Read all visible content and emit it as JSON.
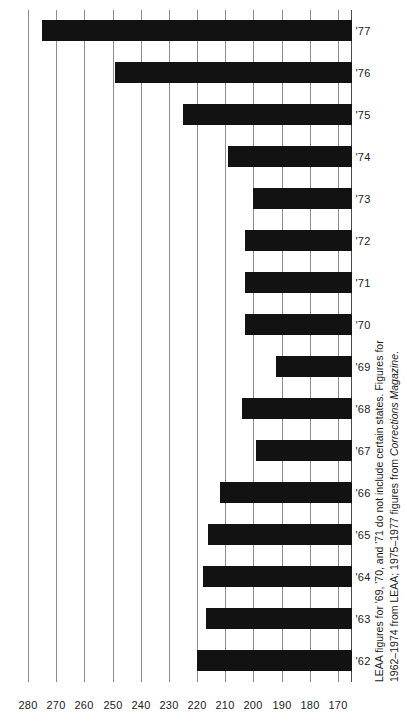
{
  "chart_data": {
    "type": "bar",
    "orientation": "horizontal-printed-sideways",
    "title": "",
    "subtitle": "",
    "xlabel": "",
    "ylabel": "",
    "categories": [
      "'62",
      "'63",
      "'64",
      "'65",
      "'66",
      "'67",
      "'68",
      "'69",
      "'70",
      "'71",
      "'72",
      "'73",
      "'74",
      "'75",
      "'76",
      "'77"
    ],
    "values": [
      220,
      217,
      218,
      216,
      212,
      199,
      204,
      192,
      203,
      203,
      203,
      200,
      209,
      225,
      249,
      275
    ],
    "value_tick_labels": [
      "280",
      "270",
      "260",
      "250",
      "240",
      "230",
      "220",
      "210",
      "200",
      "190",
      "180",
      "170"
    ],
    "value_ticks": [
      280,
      270,
      260,
      250,
      240,
      230,
      220,
      210,
      200,
      190,
      180,
      170
    ],
    "ylim": [
      165,
      285
    ],
    "axis_min": 165,
    "axis_max": 285,
    "grid": true,
    "grid_axis": "value",
    "legend": "none",
    "bar_color": "#121212",
    "grid_color": "#8d8d8d",
    "background_color": "#ffffff",
    "annotations": []
  },
  "footnote": {
    "line1": "LEAA figures for '69, '70, and '71 do not include certain states. Figures for",
    "line2_prefix": "1962–1974 from LEAA; 1975–1977 figures from ",
    "line2_italic": "Corrections Magazine",
    "line2_suffix": "."
  }
}
